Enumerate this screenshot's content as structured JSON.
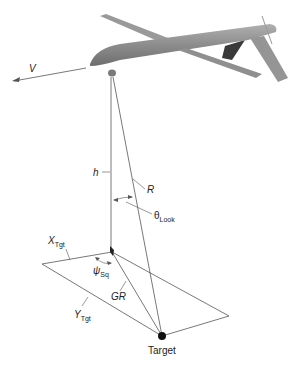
{
  "diagram": {
    "labels": {
      "velocity": "V",
      "altitude": "h",
      "slant_range": "R",
      "look_angle_symbol": "θ",
      "look_angle_sub": "Look",
      "x_target_symbol": "X",
      "x_target_sub": "Tgt",
      "y_target_symbol": "Y",
      "y_target_sub": "Tgt",
      "squint_symbol": "ψ",
      "squint_sub": "Sq",
      "ground_range": "GR",
      "target": "Target"
    },
    "colors": {
      "line": "#555555",
      "aircraft": "#8a8a8a",
      "aircraft_dark": "#3a3a3a",
      "target_dot": "#111111"
    }
  }
}
